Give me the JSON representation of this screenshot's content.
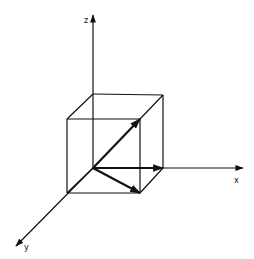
{
  "diagram": {
    "type": "3d-coordinate-axes-with-unit-cube",
    "colors": {
      "background": "#ffffff",
      "stroke": "#111111"
    },
    "axes": [
      {
        "name": "z",
        "label": "z",
        "from": [
          93,
          168
        ],
        "to": [
          93,
          15
        ],
        "label_pos": [
          84,
          23
        ]
      },
      {
        "name": "x",
        "label": "x",
        "from": [
          93,
          168
        ],
        "to": [
          243,
          168
        ],
        "label_pos": [
          234,
          183
        ]
      },
      {
        "name": "y",
        "label": "y",
        "from": [
          93,
          168
        ],
        "to": [
          16,
          246
        ],
        "label_pos": [
          24,
          250
        ]
      }
    ],
    "cube": {
      "vertices": {
        "origin": [
          93,
          168
        ],
        "back_top_left": [
          93,
          94
        ],
        "back_top_right": [
          163,
          95
        ],
        "back_bottom_right": [
          163,
          168
        ],
        "front_top_left": [
          67,
          119
        ],
        "front_top_right": [
          140,
          119
        ],
        "front_bottom_left": [
          67,
          193
        ],
        "front_bottom_right": [
          140,
          193
        ]
      }
    },
    "vectors": [
      {
        "name": "vector-x",
        "from": [
          93,
          168
        ],
        "to": [
          163,
          168
        ]
      },
      {
        "name": "vector-y",
        "from": [
          93,
          168
        ],
        "to": [
          140,
          193
        ]
      },
      {
        "name": "vector-diagonal",
        "from": [
          93,
          168
        ],
        "to": [
          140,
          119
        ]
      }
    ]
  }
}
